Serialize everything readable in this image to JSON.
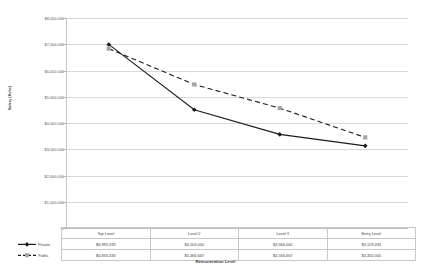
{
  "chart_data": {
    "type": "line",
    "title": "",
    "xlabel": "Remuneration Level",
    "ylabel": "Salary (Kshs)",
    "categories": [
      "Top Level",
      "Level 2",
      "Level 3",
      "Entry Level"
    ],
    "series": [
      {
        "name": "Private",
        "values": [
          6993333,
          4503000,
          3566000,
          3129333
        ],
        "labels": [
          "$6,993,333",
          "$4,503,000",
          "$3,566,000",
          "$3,129,333"
        ],
        "style": "solid",
        "marker": "diamond",
        "color": "#1a1a1a"
      },
      {
        "name": "Public",
        "values": [
          6833333,
          5466667,
          4566667,
          3450000
        ],
        "labels": [
          "$6,833,333",
          "$5,466,667",
          "$4,566,667",
          "$3,450,000"
        ],
        "style": "dashed",
        "marker": "square",
        "color": "#1a1a1a",
        "marker_color": "#a6a6a6"
      }
    ],
    "ylim": [
      0,
      8000000
    ],
    "ytick_values": [
      8000000,
      7000000,
      6000000,
      5000000,
      4000000,
      3000000,
      2000000,
      1000000,
      0
    ],
    "ytick_labels": [
      "$8,000,000",
      "$7,000,000",
      "$6,000,000",
      "$5,000,000",
      "$4,000,000",
      "$3,000,000",
      "$2,000,000",
      "$1,000,000",
      "$-"
    ],
    "grid": true,
    "legend_position": "data-table",
    "data_table": true
  },
  "colors": {
    "gridline": "#d9d9d9",
    "axis": "#bfbfbf",
    "series_line": "#1a1a1a",
    "public_marker": "#a6a6a6",
    "table_border": "#c8c8c8",
    "text": "#404040"
  }
}
